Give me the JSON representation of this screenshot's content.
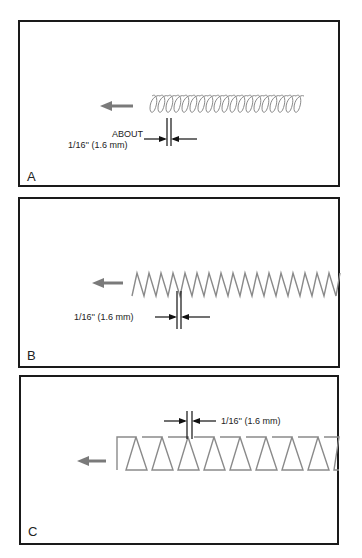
{
  "panels": [
    {
      "id": "A",
      "label": "A",
      "stitch_type": "coil/loop stitch",
      "direction": "left",
      "dimension": {
        "line1": "ABOUT",
        "line2": "1/16'' (1.6 mm)"
      }
    },
    {
      "id": "B",
      "label": "B",
      "stitch_type": "zigzag stitch",
      "direction": "left",
      "dimension": {
        "line1": "1/16'' (1.6 mm)"
      }
    },
    {
      "id": "C",
      "label": "C",
      "stitch_type": "trapezoid/box stitch",
      "direction": "left",
      "dimension": {
        "line1": "1/16'' (1.6 mm)"
      }
    }
  ],
  "colors": {
    "border": "#1a1a1a",
    "stitch": "#8a8a8a",
    "arrow": "#7a7a7a",
    "text": "#222222"
  }
}
